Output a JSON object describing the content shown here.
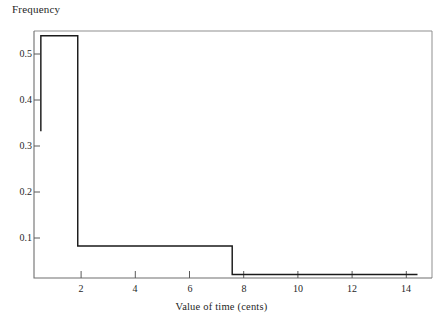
{
  "chart_data": {
    "type": "line",
    "subtype": "step-histogram",
    "title": "",
    "xlabel": "Value of time (cents)",
    "ylabel": "Frequency",
    "xlim": [
      0,
      15.1
    ],
    "ylim": [
      0.0217,
      0.5655
    ],
    "grid": false,
    "legend": null,
    "axis_frame": [
      "left",
      "bottom",
      "top",
      "right"
    ],
    "xticks": [
      2,
      4,
      6,
      8,
      10,
      12,
      14
    ],
    "xtick_labels": [
      "2",
      "4",
      "6",
      "8",
      "10",
      "12",
      "14"
    ],
    "yticks": [
      0.1,
      0.2,
      0.3,
      0.4,
      0.5
    ],
    "ytick_labels": [
      "0.1",
      "0.2",
      "0.3",
      "0.4",
      "0.5"
    ],
    "tick_direction": "in",
    "bin_edges": [
      0.26,
      1.66,
      7.52,
      14.55
    ],
    "values": [
      0.555,
      0.092,
      0.0295
    ],
    "left_riser_bottom": 0.345,
    "series": [
      {
        "name": "Frequency",
        "color": "#1a1a1a",
        "points": [
          [
            0.26,
            0.345
          ],
          [
            0.26,
            0.555
          ],
          [
            1.66,
            0.555
          ],
          [
            1.66,
            0.092
          ],
          [
            7.52,
            0.092
          ],
          [
            7.52,
            0.0295
          ],
          [
            14.55,
            0.0295
          ]
        ]
      }
    ],
    "colors": {
      "line": "#1a1a1a",
      "axis": "#6e6e6e",
      "frame": "#8a8a8a",
      "text": "#1f1f1f",
      "background": "#ffffff"
    }
  },
  "labels": {
    "y_axis_title": "Frequency",
    "x_axis_title": "Value of time (cents)"
  },
  "ytick_values": {
    "t0": "0.5",
    "t1": "0.4",
    "t2": "0.3",
    "t3": "0.2",
    "t4": "0.1"
  },
  "xtick_values": {
    "t0": "2",
    "t1": "4",
    "t2": "6",
    "t3": "8",
    "t4": "10",
    "t5": "12",
    "t6": "14"
  }
}
